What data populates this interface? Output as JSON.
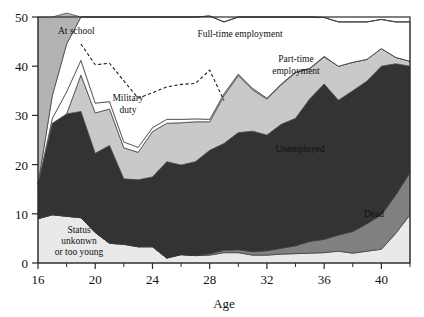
{
  "chart_data": {
    "type": "area",
    "stacked": true,
    "title": "",
    "subtitle": "",
    "xlabel": "Age",
    "ylabel": "",
    "xlim": [
      16,
      42
    ],
    "ylim": [
      0,
      50
    ],
    "grid": false,
    "legend_position": "inline-annotations",
    "x": [
      16,
      17,
      18,
      19,
      20,
      21,
      22,
      23,
      24,
      25,
      26,
      27,
      28,
      29,
      30,
      31,
      32,
      33,
      34,
      35,
      36,
      37,
      38,
      39,
      40,
      41,
      42
    ],
    "xticks_major": [
      16,
      20,
      24,
      28,
      32,
      36,
      40
    ],
    "xticks_minor": [
      18,
      22,
      26,
      30,
      34,
      38,
      42
    ],
    "yticks": [
      0,
      10,
      20,
      30,
      40,
      50
    ],
    "series": [
      {
        "name": "Status unkonwn or too young",
        "color": "#e9e9e9",
        "label_color": "#111111",
        "values": [
          9.0,
          9.8,
          9.5,
          9.2,
          6.2,
          4.0,
          3.8,
          3.3,
          3.3,
          1.0,
          1.7,
          1.5,
          1.6,
          2.1,
          2.1,
          1.6,
          1.6,
          1.8,
          1.9,
          2.0,
          2.1,
          2.4,
          2.0,
          2.4,
          2.8,
          6.0,
          9.8
        ]
      },
      {
        "name": "Dead",
        "color": "#808080",
        "label_color": "#111111",
        "values": [
          0.0,
          0.0,
          0.0,
          0.0,
          0.0,
          0.0,
          0.0,
          0.0,
          0.0,
          0.0,
          0.0,
          0.0,
          0.3,
          0.5,
          0.6,
          0.7,
          0.9,
          1.2,
          1.6,
          2.4,
          2.7,
          3.3,
          4.4,
          5.6,
          7.0,
          7.8,
          8.6
        ]
      },
      {
        "name": "Unemployed",
        "color": "#333333",
        "label_color": "#f2f2f2",
        "values": [
          7.0,
          18.6,
          20.8,
          21.6,
          16.1,
          19.9,
          13.3,
          13.6,
          14.2,
          19.6,
          18.2,
          19.1,
          21.0,
          21.7,
          23.8,
          24.5,
          23.5,
          25.2,
          25.9,
          29.0,
          31.6,
          27.4,
          28.6,
          29.0,
          30.2,
          26.7,
          21.6
        ]
      },
      {
        "name": "Part-time employment",
        "color": "#c9c9c9",
        "label_color": "#111111",
        "values": [
          0.0,
          0.0,
          0.0,
          7.4,
          8.2,
          7.4,
          6.3,
          5.6,
          9.2,
          7.8,
          8.6,
          8.1,
          5.8,
          9.7,
          11.6,
          8.4,
          7.3,
          8.0,
          9.3,
          6.1,
          5.5,
          6.9,
          5.8,
          4.4,
          3.6,
          1.3,
          1.0
        ]
      },
      {
        "name": "Military duty",
        "color": "#fdfdfd",
        "label_color": "#111111",
        "values": [
          0.0,
          1.0,
          4.5,
          3.0,
          2.0,
          1.5,
          1.2,
          1.0,
          0.8,
          0.8,
          0.7,
          0.6,
          0.5,
          0.4,
          0.3,
          0.3,
          0.2,
          0.2,
          0.1,
          0.1,
          0.1,
          0.0,
          0.0,
          0.0,
          0.0,
          0.0,
          0.0
        ]
      },
      {
        "name": "Full-time employment",
        "color": "#ffffff",
        "label_color": "#111111",
        "values": [
          0.0,
          4.6,
          9.7,
          8.8,
          17.5,
          17.2,
          25.4,
          26.5,
          22.5,
          20.8,
          20.8,
          20.7,
          21.0,
          14.6,
          11.6,
          14.5,
          16.5,
          13.6,
          11.2,
          10.4,
          7.9,
          9.0,
          8.2,
          7.6,
          5.9,
          7.2,
          8.0
        ]
      },
      {
        "name": "At school",
        "color": "#b3b3b3",
        "label_color": "#111111",
        "values": [
          34.0,
          16.0,
          6.3,
          0.0,
          0.0,
          0.0,
          0.0,
          0.0,
          0.0,
          0.0,
          0.0,
          0.0,
          0.0,
          0.0,
          0.0,
          0.0,
          0.0,
          0.0,
          0.0,
          0.0,
          0.0,
          0.0,
          0.0,
          0.0,
          0.0,
          0.0,
          0.0
        ]
      }
    ],
    "dashed_line": {
      "name": "full-time-employment-reference",
      "style": "dashed",
      "color": "#1a1a1a",
      "values": [
        null,
        null,
        null,
        44.5,
        40.3,
        40.6,
        37.0,
        33.5,
        34.6,
        35.8,
        36.3,
        36.5,
        39.2,
        33.0,
        null,
        null,
        null,
        null,
        null,
        null,
        null,
        null,
        null,
        null,
        null,
        null,
        null
      ]
    },
    "annotations": [
      {
        "key": "at_school",
        "text": "At school",
        "x": 58,
        "y": 34,
        "fill": "#111111",
        "align": "start"
      },
      {
        "key": "full_time",
        "text": "Full-time employment",
        "x": 240,
        "y": 37,
        "fill": "#111111",
        "align": "middle"
      },
      {
        "key": "part_time_1",
        "text": "Part-time",
        "x": 296,
        "y": 62,
        "fill": "#111111",
        "align": "middle"
      },
      {
        "key": "part_time_2",
        "text": "employment",
        "x": 296,
        "y": 74,
        "fill": "#111111",
        "align": "middle"
      },
      {
        "key": "military_1",
        "text": "Military",
        "x": 128,
        "y": 101,
        "fill": "#111111",
        "align": "middle"
      },
      {
        "key": "military_2",
        "text": "duty",
        "x": 128,
        "y": 113,
        "fill": "#111111",
        "align": "middle"
      },
      {
        "key": "unemployed",
        "text": "Unemployed",
        "x": 300,
        "y": 152,
        "fill": "#f2f2f2",
        "align": "middle"
      },
      {
        "key": "dead",
        "text": "Dead",
        "x": 374,
        "y": 217,
        "fill": "#111111",
        "align": "middle"
      },
      {
        "key": "status_1",
        "text": "Status",
        "x": 79,
        "y": 233,
        "fill": "#111111",
        "align": "middle"
      },
      {
        "key": "status_2",
        "text": "unkonwn",
        "x": 79,
        "y": 244,
        "fill": "#111111",
        "align": "middle"
      },
      {
        "key": "status_3",
        "text": "or too young",
        "x": 79,
        "y": 255,
        "fill": "#111111",
        "align": "middle"
      }
    ],
    "axis_title": "Age",
    "ytick_labels": [
      "0",
      "10",
      "20",
      "30",
      "40",
      "50"
    ],
    "xtick_labels": [
      "16",
      "20",
      "24",
      "28",
      "32",
      "36",
      "40"
    ]
  }
}
